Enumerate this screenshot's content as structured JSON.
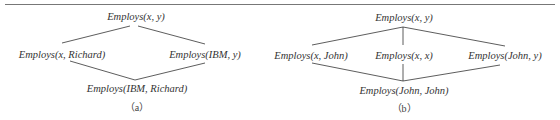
{
  "diagrams": [
    {
      "id": "a",
      "caption": "（a）",
      "nodes": {
        "top": "Employs(x, y)",
        "left": "Employs(x, Richard)",
        "right": "Employs(IBM, y)",
        "bottom": "Employs(IBM, Richard)"
      },
      "edges": [
        [
          "top",
          "left"
        ],
        [
          "top",
          "right"
        ],
        [
          "left",
          "bottom"
        ],
        [
          "right",
          "bottom"
        ]
      ]
    },
    {
      "id": "b",
      "caption": "（b）",
      "nodes": {
        "top": "Employs(x, y)",
        "left": "Employs(x, John)",
        "middle": "Employs(x, x)",
        "right": "Employs(John, y)",
        "bottom": "Employs(John, John)"
      },
      "edges": [
        [
          "top",
          "left"
        ],
        [
          "top",
          "middle"
        ],
        [
          "top",
          "right"
        ],
        [
          "left",
          "bottom"
        ],
        [
          "middle",
          "bottom"
        ],
        [
          "right",
          "bottom"
        ]
      ]
    }
  ],
  "colors": {
    "line": "#333333",
    "text": "#333333",
    "rule": "#777777"
  }
}
